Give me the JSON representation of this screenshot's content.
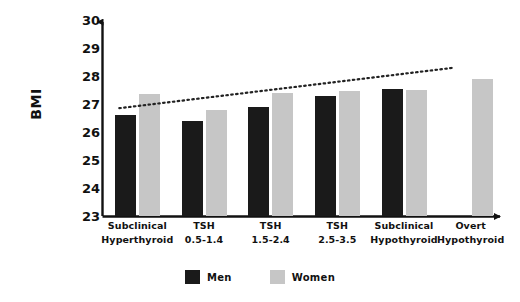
{
  "chart_data": {
    "type": "bar",
    "title": "",
    "subtitle": "",
    "xlabel": "",
    "ylabel": "BMI",
    "ylim": [
      23,
      30
    ],
    "yticks": [
      30,
      29,
      28,
      27,
      26,
      25,
      24,
      23
    ],
    "grid": false,
    "legend_position": "bottom-center",
    "categories": [
      "Subclinical Hyperthyroid",
      "TSH 0.5-1.4",
      "TSH 1.5-2.4",
      "TSH 2.5-3.5",
      "Subclinical Hypothyroid",
      "Overt Hypothyroid"
    ],
    "category_lines": [
      [
        "Subclinical",
        "Hyperthyroid"
      ],
      [
        "TSH",
        "0.5-1.4"
      ],
      [
        "TSH",
        "1.5-2.4"
      ],
      [
        "TSH",
        "2.5-3.5"
      ],
      [
        "Subclinical",
        "Hypothyroid"
      ],
      [
        "Overt",
        "Hypothyroid"
      ]
    ],
    "series": [
      {
        "name": "Men",
        "color": "#1a1a1a",
        "values": [
          26.6,
          26.4,
          26.9,
          27.3,
          27.55,
          null
        ]
      },
      {
        "name": "Women",
        "color": "#c6c6c6",
        "values": [
          27.35,
          26.8,
          27.4,
          27.45,
          27.5,
          27.9
        ]
      }
    ],
    "trendline": {
      "style": "dotted",
      "color": "#222222",
      "x_start_category_index": 0,
      "x_end_category_index": 5,
      "y_start": 26.85,
      "y_end": 28.3
    }
  },
  "legend": {
    "items": [
      {
        "label": "Men",
        "color": "#1a1a1a"
      },
      {
        "label": "Women",
        "color": "#c6c6c6"
      }
    ]
  },
  "axes": {
    "y_title": "BMI",
    "y_tick_labels": [
      "30",
      "29",
      "28",
      "27",
      "26",
      "25",
      "24",
      "23"
    ]
  },
  "colors": {
    "men": "#1a1a1a",
    "women": "#c6c6c6",
    "axis": "#111111",
    "trendline": "#222222",
    "background": "#ffffff"
  }
}
